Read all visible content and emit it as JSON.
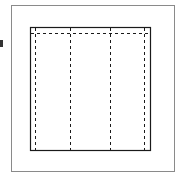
{
  "diagram": {
    "colors": {
      "background": "#ffffff",
      "outer_frame": "#8a8a8a",
      "inner_box": "#1a1a1a",
      "dashed_lines": "#1a1a1a",
      "edge_marker": "#333333"
    },
    "outer_frame": {
      "x": 11,
      "y": 5,
      "width": 163,
      "height": 167
    },
    "inner_box": {
      "x": 30,
      "y": 27,
      "width": 121,
      "height": 124
    },
    "dashed_verticals_x": [
      35,
      70,
      110,
      144
    ],
    "dashed_horizontal_y": 33,
    "edge_marker": {
      "x": 0,
      "y": 40,
      "width": 3,
      "height": 7
    }
  }
}
